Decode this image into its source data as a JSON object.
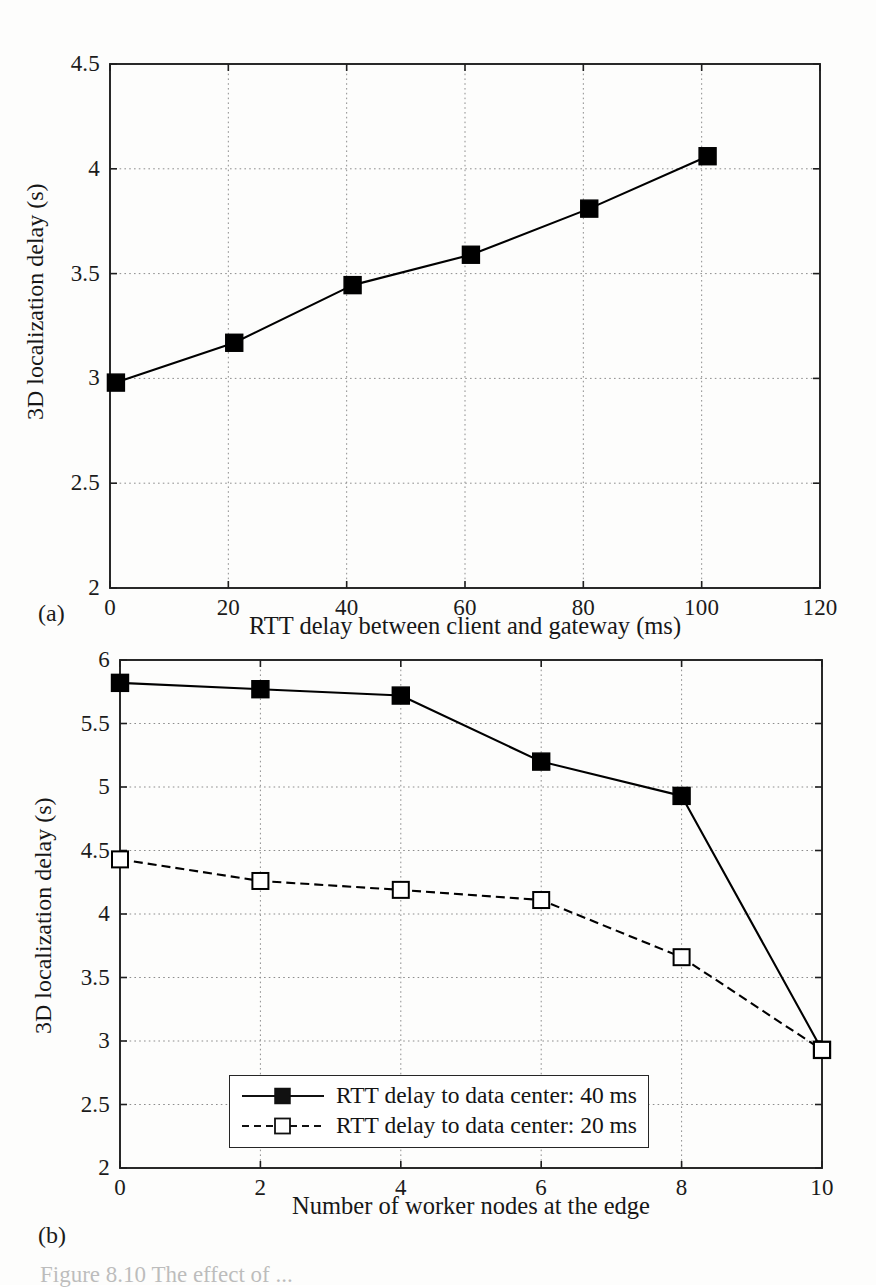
{
  "figure": {
    "caption": "Figure 8.10   The effect of ...",
    "subfigure_a_label": "(a)",
    "subfigure_b_label": "(b)"
  },
  "chart_data": [
    {
      "id": "chart-a",
      "type": "line",
      "title": "",
      "xlabel": "RTT delay between client and gateway (ms)",
      "ylabel": "3D localization delay (s)",
      "xlim": [
        0,
        120
      ],
      "ylim": [
        2,
        4.5
      ],
      "xticks": [
        0,
        20,
        40,
        60,
        80,
        100,
        120
      ],
      "xtick_labels": [
        "0",
        "20",
        "40",
        "60",
        "80",
        "100",
        "120"
      ],
      "yticks": [
        2,
        2.5,
        3,
        3.5,
        4,
        4.5
      ],
      "ytick_labels": [
        "2",
        "2.5",
        "3",
        "3.5",
        "4",
        "4.5"
      ],
      "grid": true,
      "legend": null,
      "series": [
        {
          "name": "3D localization delay",
          "marker": "filled-square",
          "line_style": "solid",
          "color": "#000000",
          "x": [
            1,
            21,
            41,
            61,
            81,
            101
          ],
          "values": [
            2.98,
            3.17,
            3.445,
            3.59,
            3.81,
            4.06
          ]
        }
      ]
    },
    {
      "id": "chart-b",
      "type": "line",
      "title": "",
      "xlabel": "Number of worker nodes at the edge",
      "ylabel": "3D localization delay (s)",
      "xlim": [
        0,
        10
      ],
      "ylim": [
        2,
        6
      ],
      "xticks": [
        0,
        2,
        4,
        6,
        8,
        10
      ],
      "xtick_labels": [
        "0",
        "2",
        "4",
        "6",
        "8",
        "10"
      ],
      "yticks": [
        2,
        2.5,
        3,
        3.5,
        4,
        4.5,
        5,
        5.5,
        6
      ],
      "ytick_labels": [
        "2",
        "2.5",
        "3",
        "3.5",
        "4",
        "4.5",
        "5",
        "5.5",
        "6"
      ],
      "grid": true,
      "legend": {
        "position": "bottom-center",
        "entries": [
          "RTT delay to data center: 40 ms",
          "RTT delay to data center: 20 ms"
        ]
      },
      "series": [
        {
          "name": "RTT delay to data center: 40 ms",
          "marker": "filled-square",
          "line_style": "solid",
          "color": "#000000",
          "x": [
            0,
            2,
            4,
            6,
            8,
            10
          ],
          "values": [
            5.82,
            5.77,
            5.72,
            5.2,
            4.93,
            2.93
          ]
        },
        {
          "name": "RTT delay to data center: 20 ms",
          "marker": "open-square",
          "line_style": "dashed",
          "color": "#000000",
          "x": [
            0,
            2,
            4,
            6,
            8,
            10
          ],
          "values": [
            4.43,
            4.26,
            4.19,
            4.11,
            3.66,
            2.93
          ]
        }
      ]
    }
  ]
}
